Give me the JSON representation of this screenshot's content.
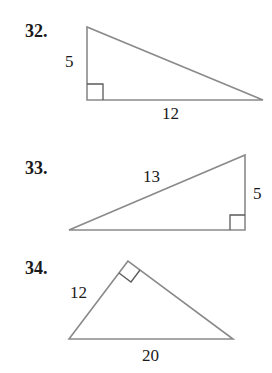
{
  "problems": [
    {
      "number": "32.",
      "labels": {
        "left_leg": "5",
        "bottom_leg": "12"
      },
      "right_angle": "bottom-left"
    },
    {
      "number": "33.",
      "labels": {
        "hypotenuse": "13",
        "right_leg": "5"
      },
      "right_angle": "bottom-right"
    },
    {
      "number": "34.",
      "labels": {
        "left_leg": "12",
        "hypotenuse": "20"
      },
      "right_angle": "top"
    }
  ],
  "colors": {
    "stroke": "#8a8a8a",
    "text": "#1a1a1a"
  }
}
